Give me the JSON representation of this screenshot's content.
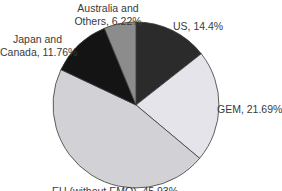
{
  "chart_data": {
    "type": "pie",
    "title": "",
    "start_angle_deg": 0,
    "direction": "clockwise",
    "slices": [
      {
        "label": "US",
        "value": 14.4,
        "display": "US, 14.4%",
        "color": "#2b2b2b"
      },
      {
        "label": "GEM",
        "value": 21.69,
        "display": "GEM, 21.69%",
        "color": "#e4e4ea"
      },
      {
        "label": "EU (without EMQ)",
        "value": 45.93,
        "display": "EU (without EMQ), 45.93%",
        "color": "#d2d2d6"
      },
      {
        "label": "Japan and Canada",
        "value": 11.76,
        "display": "Japan and Canada, 11.76%",
        "color": "#141414"
      },
      {
        "label": "Australia and Others",
        "value": 6.22,
        "display": "Australia and Others, 6.22%",
        "color": "#8c8c8c"
      }
    ],
    "legend": "none (labels placed beside slices)"
  },
  "labels": {
    "us": "US, 14.4%",
    "gem": "GEM, 21.69%",
    "eu": "EU (without EMQ), 45.93%",
    "japan_line1": "Japan and",
    "japan_line2": "Canada, 11.76%",
    "australia_line1": "Australia and",
    "australia_line2": "Others, 6.22%"
  }
}
